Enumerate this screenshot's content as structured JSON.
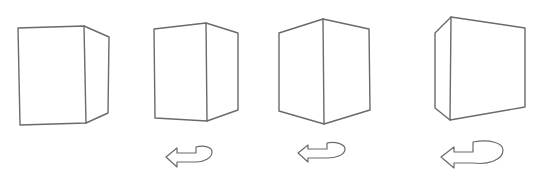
{
  "figure": {
    "stroke_color": "#6a6a6a",
    "background": "#ffffff",
    "cubes": [
      {
        "id": "cube-1",
        "paths": [
          "M18,28 L84,26 L86,123 L20,125 Z",
          "M84,26 L109,37 L108,113 L86,123"
        ]
      },
      {
        "id": "cube-2",
        "paths": [
          "M154,29 L206,23 L207,121 L155,118 Z",
          "M206,23 L238,33 L238,110 L207,121"
        ]
      },
      {
        "id": "cube-3",
        "paths": [
          "M279,33 L323,19 L324,124 L279,111 Z",
          "M323,19 L369,29 L370,110 L324,124"
        ]
      },
      {
        "id": "cube-4",
        "paths": [
          "M451,17 L525,28 L525,107 L450,120 Z",
          "M451,17 L435,33 L435,108 L450,120"
        ]
      }
    ],
    "arrows": [
      {
        "id": "rotation-arrow-1",
        "path": "M166,157 L177,148 L177,153 L196,153 L196,147 C204,145 212,147 212,152 C212,158 204,162 196,162 L177,162 L177,167 Z M196,147 L196,153"
      },
      {
        "id": "rotation-arrow-2",
        "path": "M298,153 L308,145 L308,149 L327,149 L327,143 C335,141 345,144 345,149 C345,155 336,158 327,158 L308,158 L308,162 Z M327,143 L327,149"
      },
      {
        "id": "rotation-arrow-3",
        "path": "M441,157 L454,147 L454,152 L473,152 L473,142 C490,139 503,143 503,150 C503,160 488,165 473,163 L454,163 L454,168 Z M473,142 L473,152"
      }
    ]
  }
}
